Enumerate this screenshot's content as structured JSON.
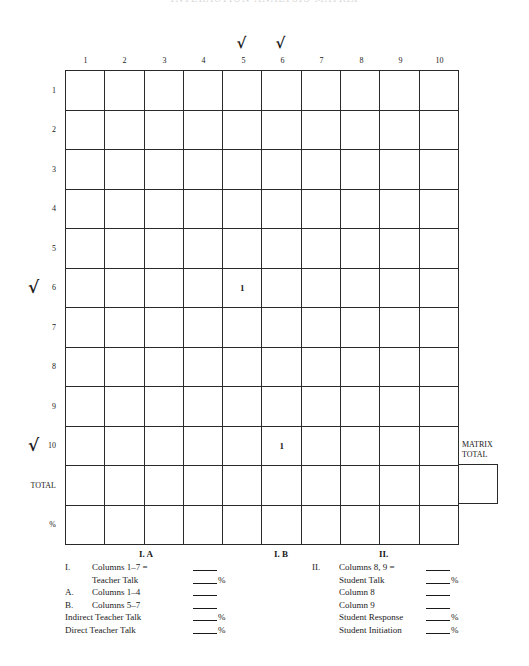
{
  "page": {
    "title": "INTERACTION ANALYSIS MATRIX"
  },
  "matrix": {
    "column_labels": [
      "1",
      "2",
      "3",
      "4",
      "5",
      "6",
      "7",
      "8",
      "9",
      "10"
    ],
    "row_labels": [
      "1",
      "2",
      "3",
      "4",
      "5",
      "6",
      "7",
      "8",
      "9",
      "10",
      "TOTAL",
      "%"
    ],
    "checked_columns": [
      "5",
      "6"
    ],
    "checked_rows": [
      "6",
      "10"
    ],
    "check_glyph": "√",
    "cells": {
      "r6c5": "1",
      "r10c6": "1"
    },
    "matrix_total_label_line1": "MATRIX",
    "matrix_total_label_line2": "TOTAL",
    "matrix_total_value": ""
  },
  "section_headings": {
    "ia": "I. A",
    "ib": "I. B",
    "ii": "II."
  },
  "summary_left": {
    "lines": [
      {
        "num": "I.",
        "text": "Columns 1–7 =",
        "pct": ""
      },
      {
        "num": "",
        "text": "Teacher Talk",
        "pct": "%"
      },
      {
        "num": "A.",
        "text": "Columns 1–4",
        "pct": ""
      },
      {
        "num": "B.",
        "text": "Columns 5–7",
        "pct": ""
      },
      {
        "num": "",
        "text": "Indirect Teacher Talk",
        "pct": "%"
      },
      {
        "num": "",
        "text": "Direct Teacher Talk",
        "pct": "%"
      }
    ]
  },
  "summary_right": {
    "lines": [
      {
        "num": "II.",
        "text": "Columns 8, 9 =",
        "pct": ""
      },
      {
        "num": "",
        "text": "Student Talk",
        "pct": "%"
      },
      {
        "num": "",
        "text": "Column 8",
        "pct": ""
      },
      {
        "num": "",
        "text": "Column 9",
        "pct": ""
      },
      {
        "num": "",
        "text": "Student Response",
        "pct": "%"
      },
      {
        "num": "",
        "text": "Student Initiation",
        "pct": "%"
      }
    ]
  }
}
